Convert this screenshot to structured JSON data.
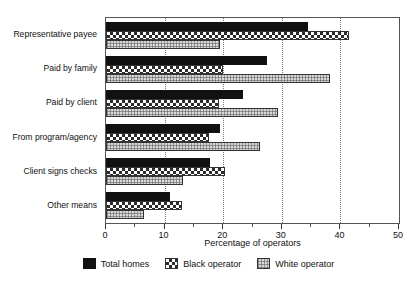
{
  "chart_data": {
    "type": "bar",
    "orientation": "horizontal",
    "title": "",
    "subtitle": "",
    "xlabel": "Percentage of operators",
    "ylabel": "",
    "xlim": [
      0,
      50
    ],
    "xticks": [
      0,
      10,
      20,
      30,
      40,
      50
    ],
    "xtick_labels": [
      "0",
      "10",
      "20",
      "30",
      "40",
      "50"
    ],
    "minor_tick_step": 5,
    "grid": "vertical-dotted-at-major-ticks",
    "legend_position": "bottom-center",
    "categories": [
      "Representative payee",
      "Paid by family",
      "Paid by client",
      "From program/agency",
      "Client signs checks",
      "Other means"
    ],
    "series": [
      {
        "name": "Total homes",
        "pattern": "solid-black",
        "color": "#111111",
        "values": [
          34.4,
          27.5,
          23.4,
          19.5,
          17.8,
          11.0
        ]
      },
      {
        "name": "Black operator",
        "pattern": "checkerboard",
        "color": "#2b2b2b",
        "values": [
          41.5,
          20.0,
          19.2,
          17.5,
          20.3,
          13.0
        ]
      },
      {
        "name": "White operator",
        "pattern": "fine-grid-gray",
        "color": "#d8d8d8",
        "values": [
          19.5,
          38.3,
          29.3,
          26.2,
          13.2,
          6.5
        ]
      }
    ]
  },
  "axis": {
    "x_title": "Percentage of operators"
  },
  "legend": {
    "items": [
      {
        "label": "Total homes"
      },
      {
        "label": "Black operator"
      },
      {
        "label": "White operator"
      }
    ]
  }
}
